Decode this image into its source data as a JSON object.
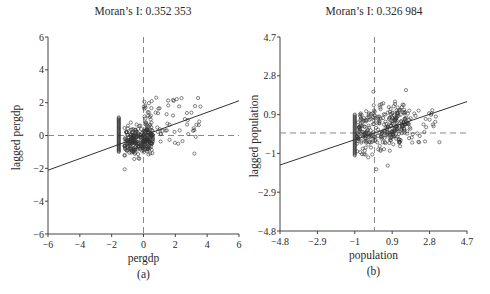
{
  "chart_data": [
    {
      "type": "scatter",
      "panel_label": "(a)",
      "title": "Moran’s I: 0.352 353",
      "xlabel": "pergdp",
      "ylabel": "lagged pergdp",
      "xlim": [
        -6,
        6
      ],
      "ylim": [
        -6,
        6
      ],
      "xticks": [
        "−6",
        "−4",
        "−2",
        "0",
        "2",
        "4",
        "6"
      ],
      "yticks": [
        "6",
        "4",
        "2",
        "0",
        "−2",
        "−4",
        "−6"
      ],
      "grid": false,
      "reference_lines": {
        "x_mean": 0,
        "y_mean": 0,
        "style": "dashed"
      },
      "regression_line": {
        "slope": 0.352353,
        "intercept": 0.0
      },
      "clusters": [
        {
          "description": "vertical column of points at minimum x",
          "x": -1.55,
          "y_range": [
            -1.0,
            1.1
          ]
        },
        {
          "description": "dense cluster near origin",
          "x_range": [
            -1.2,
            0.6
          ],
          "y_range": [
            -1.1,
            0.7
          ]
        },
        {
          "description": "spread of high-high points",
          "x_range": [
            0,
            3.6
          ],
          "y_range": [
            -0.5,
            2.4
          ]
        }
      ],
      "outliers": [
        [
          3.5,
          0.85
        ],
        [
          3.2,
          -1.1
        ],
        [
          2.6,
          1.0
        ],
        [
          0.8,
          2.3
        ]
      ]
    },
    {
      "type": "scatter",
      "panel_label": "(b)",
      "title": "Moran’s I: 0.326 984",
      "xlabel": "population",
      "ylabel": "lagged population",
      "xlim": [
        -4.8,
        4.7
      ],
      "ylim": [
        -4.8,
        4.7
      ],
      "xticks": [
        "−4.8",
        "−2.9",
        "−1",
        "0.9",
        "2.8",
        "4.7"
      ],
      "yticks": [
        "4.7",
        "2.8",
        "0.9",
        "−1",
        "−2.9",
        "−4.8"
      ],
      "grid": false,
      "reference_lines": {
        "x_mean": 0,
        "y_mean": 0,
        "style": "dashed"
      },
      "regression_line": {
        "slope": 0.326984,
        "intercept": 0.0
      },
      "clusters": [
        {
          "description": "vertical column of points at minimum x",
          "x": -1.0,
          "y_range": [
            -1.1,
            0.9
          ]
        },
        {
          "description": "dense cluster",
          "x_range": [
            -0.9,
            1.6
          ],
          "y_range": [
            -1.0,
            1.3
          ]
        },
        {
          "description": "high-value spread",
          "x_range": [
            0.8,
            3.2
          ],
          "y_range": [
            -0.5,
            1.2
          ]
        }
      ],
      "outliers": [
        [
          1.6,
          2.1
        ],
        [
          3.3,
          -0.45
        ],
        [
          2.8,
          0.65
        ]
      ]
    }
  ]
}
